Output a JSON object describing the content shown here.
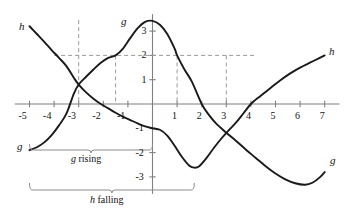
{
  "figure": {
    "title": "",
    "background": "#ffffff",
    "curve_color": "#1a1a1a",
    "axis_color": "#808080",
    "dash_color": "#9a9a9a",
    "bracket_color": "#8c8c8c"
  },
  "axes": {
    "x_ticks": [
      "-5",
      "-4",
      "-3",
      "-2",
      "-1",
      "1",
      "2",
      "3",
      "4",
      "5",
      "6",
      "7"
    ],
    "y_ticks": [
      "3",
      "2",
      "1",
      "-1",
      "-2",
      "-3"
    ],
    "xlim": [
      -5.6,
      7.6
    ],
    "ylim": [
      -3.7,
      3.7
    ],
    "grid": false
  },
  "curve_labels": {
    "h_left": "h",
    "h_right": "h",
    "g_top": "g",
    "g_left": "g",
    "g_right": "g"
  },
  "brackets": {
    "g_rising": "g rising",
    "h_falling": "h falling"
  },
  "annotations": {
    "g_rising_range": [
      -5,
      0
    ],
    "h_falling_range": [
      -5,
      1.7
    ],
    "dashed_vertical_x": [
      -3,
      -1.5,
      1,
      3
    ],
    "dashed_horizontal_y": [
      2
    ]
  },
  "chart_data": {
    "type": "line",
    "title": "",
    "xlabel": "",
    "ylabel": "",
    "xlim": [
      -5.6,
      7.6
    ],
    "ylim": [
      -3.7,
      3.7
    ],
    "grid": false,
    "legend": "inline-curve-labels",
    "series": [
      {
        "name": "g",
        "label": "g",
        "points": [
          [
            -5.0,
            -1.9
          ],
          [
            -4.7,
            -1.78
          ],
          [
            -4.4,
            -1.58
          ],
          [
            -4.1,
            -1.28
          ],
          [
            -3.8,
            -0.88
          ],
          [
            -3.5,
            -0.4
          ],
          [
            -3.2,
            0.42
          ],
          [
            -3.0,
            0.8
          ],
          [
            -2.7,
            1.12
          ],
          [
            -2.4,
            1.42
          ],
          [
            -2.1,
            1.7
          ],
          [
            -1.8,
            1.9
          ],
          [
            -1.5,
            2.0
          ],
          [
            -1.2,
            2.28
          ],
          [
            -0.9,
            2.72
          ],
          [
            -0.6,
            3.12
          ],
          [
            -0.3,
            3.38
          ],
          [
            0.0,
            3.42
          ],
          [
            0.3,
            3.26
          ],
          [
            0.6,
            2.88
          ],
          [
            0.9,
            2.28
          ],
          [
            1.0,
            2.0
          ],
          [
            1.3,
            1.42
          ],
          [
            1.6,
            0.92
          ],
          [
            2.0,
            0.0
          ],
          [
            2.3,
            -0.46
          ],
          [
            2.6,
            -0.82
          ],
          [
            3.0,
            -1.18
          ],
          [
            3.4,
            -1.52
          ],
          [
            3.8,
            -1.88
          ],
          [
            4.2,
            -2.22
          ],
          [
            4.6,
            -2.56
          ],
          [
            5.0,
            -2.86
          ],
          [
            5.4,
            -3.1
          ],
          [
            5.8,
            -3.26
          ],
          [
            6.2,
            -3.32
          ],
          [
            6.5,
            -3.24
          ],
          [
            6.8,
            -3.02
          ],
          [
            7.0,
            -2.8
          ]
        ]
      },
      {
        "name": "h",
        "label": "h",
        "points": [
          [
            -5.0,
            3.2
          ],
          [
            -4.7,
            2.88
          ],
          [
            -4.4,
            2.56
          ],
          [
            -4.1,
            2.22
          ],
          [
            -3.8,
            1.9
          ],
          [
            -3.5,
            1.56
          ],
          [
            -3.2,
            1.08
          ],
          [
            -3.0,
            0.8
          ],
          [
            -2.7,
            0.48
          ],
          [
            -2.4,
            0.22
          ],
          [
            -2.1,
            0.0
          ],
          [
            -1.8,
            -0.18
          ],
          [
            -1.5,
            -0.36
          ],
          [
            -1.2,
            -0.52
          ],
          [
            -0.9,
            -0.66
          ],
          [
            -0.6,
            -0.8
          ],
          [
            -0.3,
            -0.92
          ],
          [
            0.0,
            -1.0
          ],
          [
            0.3,
            -1.06
          ],
          [
            0.6,
            -1.3
          ],
          [
            0.9,
            -1.72
          ],
          [
            1.2,
            -2.18
          ],
          [
            1.5,
            -2.54
          ],
          [
            1.7,
            -2.62
          ],
          [
            1.9,
            -2.56
          ],
          [
            2.2,
            -2.22
          ],
          [
            2.5,
            -1.8
          ],
          [
            2.8,
            -1.42
          ],
          [
            3.1,
            -1.08
          ],
          [
            3.4,
            -0.76
          ],
          [
            3.7,
            -0.38
          ],
          [
            4.0,
            0.0
          ],
          [
            4.4,
            0.34
          ],
          [
            4.8,
            0.66
          ],
          [
            5.2,
            0.98
          ],
          [
            5.6,
            1.26
          ],
          [
            6.0,
            1.5
          ],
          [
            6.4,
            1.7
          ],
          [
            6.8,
            1.9
          ],
          [
            7.0,
            2.0
          ]
        ]
      }
    ],
    "key_features": {
      "g_peak": [
        -0.2,
        3.42
      ],
      "g_min": [
        6.2,
        -3.32
      ],
      "h_min": [
        1.7,
        -2.62
      ],
      "curve_intersections": [
        [
          -3.0,
          0.8
        ],
        [
          3.2,
          -1.28
        ]
      ],
      "g_zero_crossings": [
        -3.35,
        2.0
      ],
      "h_zero_crossings": [
        -2.1,
        4.0
      ],
      "g_at_neg1p5": 2.0,
      "g_at_1": 2.0
    }
  }
}
